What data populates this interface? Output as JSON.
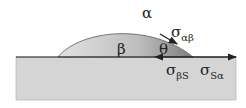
{
  "labels": {
    "alpha": "α",
    "beta": "β",
    "theta": "θ",
    "sigma_ab": {
      "main": "σ",
      "sub": "αβ"
    },
    "sigma_bs": {
      "main": "σ",
      "sub": "βS"
    },
    "sigma_sa": {
      "main": "σ",
      "sub": "Sα"
    }
  },
  "colors": {
    "substrate": "#d4d4d4",
    "droplet_light": "#dcdcdc",
    "droplet_dark": "#8a8a8a",
    "line": "#222222"
  }
}
